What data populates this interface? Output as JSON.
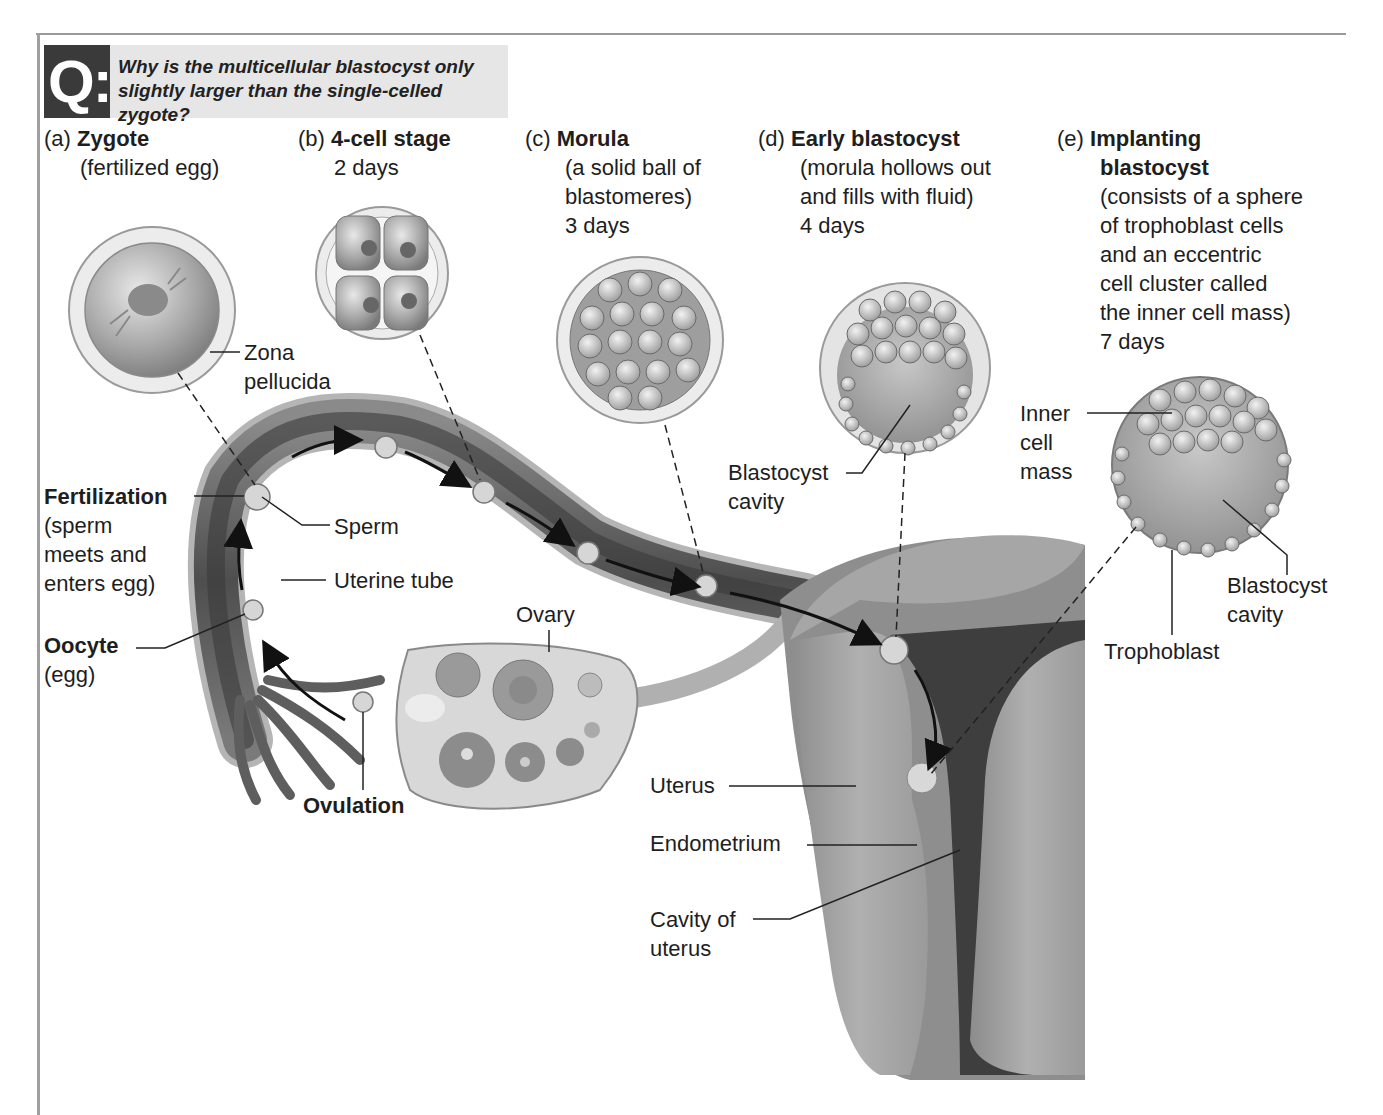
{
  "question": {
    "badge": "Q:",
    "text": "Why is the multicellular blastocyst only slightly larger than the single-celled zygote?"
  },
  "stages": [
    {
      "letter": "(a)",
      "title": "Zygote",
      "description": [
        "(fertilized egg)"
      ]
    },
    {
      "letter": "(b)",
      "title": "4-cell stage",
      "description": [
        "2 days"
      ]
    },
    {
      "letter": "(c)",
      "title": "Morula",
      "description": [
        "(a solid ball of",
        "blastomeres)",
        "3 days"
      ]
    },
    {
      "letter": "(d)",
      "title": "Early blastocyst",
      "description": [
        "(morula hollows out",
        "and fills with fluid)",
        "4 days"
      ]
    },
    {
      "letter": "(e)",
      "title": "Implanting",
      "title2": "blastocyst",
      "description": [
        "(consists of a sphere",
        "of trophoblast cells",
        "and an eccentric",
        "cell cluster called",
        "the inner cell mass)",
        "7 days"
      ]
    }
  ],
  "labels": {
    "zona_pellucida": [
      "Zona",
      "pellucida"
    ],
    "fertilization": {
      "title": "Fertilization",
      "description": [
        "(sperm",
        "meets and",
        "enters egg)"
      ]
    },
    "sperm": "Sperm",
    "uterine_tube": "Uterine tube",
    "oocyte": {
      "title": "Oocyte",
      "description": "(egg)"
    },
    "ovary": "Ovary",
    "ovulation": "Ovulation",
    "blastocyst_cavity_d": [
      "Blastocyst",
      "cavity"
    ],
    "inner_cell_mass": [
      "Inner",
      "cell",
      "mass"
    ],
    "blastocyst_cavity_e": [
      "Blastocyst",
      "cavity"
    ],
    "trophoblast": "Trophoblast",
    "uterus": "Uterus",
    "endometrium": "Endometrium",
    "cavity_of_uterus": [
      "Cavity of",
      "uterus"
    ]
  },
  "colors": {
    "qbadge": "#3a3a3a",
    "qbox": "#e6e6e6",
    "tube_dark": "#4a4a4a",
    "tissue": "#9a9a9a",
    "cell_fill": "#b5b5b5"
  }
}
